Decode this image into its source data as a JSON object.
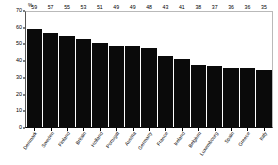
{
  "chart_data": {
    "type": "bar",
    "title": "",
    "subtitle": "",
    "xlabel": "",
    "ylabel": "%",
    "unit_label": "%",
    "ylim": [
      0,
      70
    ],
    "ytick_step": 10,
    "yticks": [
      0,
      10,
      20,
      30,
      40,
      50,
      60,
      70
    ],
    "ytick_labels": [
      "0",
      "10",
      "20",
      "30",
      "40",
      "50",
      "60",
      "70"
    ],
    "grid": false,
    "legend": null,
    "bar_color": "#0a0a0a",
    "value_labels_shown": true,
    "categories": [
      "Denmark",
      "Sweden",
      "Finland",
      "Britain",
      "Holland",
      "Portugal",
      "Austria",
      "Germany",
      "France",
      "Ireland",
      "Belgium",
      "Luxembourg",
      "Spain",
      "Greece",
      "Italy"
    ],
    "values": [
      59,
      57,
      55,
      53,
      51,
      49,
      49,
      48,
      43,
      41,
      38,
      37,
      36,
      36,
      35
    ]
  }
}
